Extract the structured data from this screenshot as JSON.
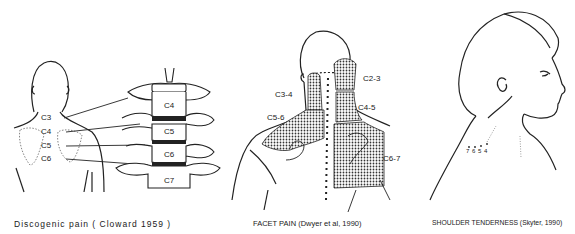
{
  "figure": {
    "panels": [
      {
        "id": "discogenic",
        "caption": "Discogenic pain  ( Cloward 1959 )",
        "body_labels": [
          "C3",
          "C4",
          "C5",
          "C6"
        ],
        "vertebra_labels": [
          "C4",
          "C5",
          "C6",
          "C7"
        ]
      },
      {
        "id": "facet",
        "caption": "FACET PAIN (Dwyer et al, 1990)",
        "region_labels": [
          "C2-3",
          "C3-4",
          "C4-5",
          "C5-6",
          "C6-7"
        ]
      },
      {
        "id": "shoulder",
        "caption": "SHOULDER TENDERNESS (Skyter, 1990)",
        "point_labels": [
          "7",
          "6",
          "5",
          "4"
        ]
      }
    ]
  }
}
